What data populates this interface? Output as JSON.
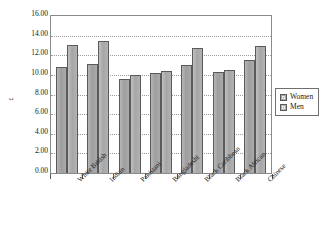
{
  "chart_data": {
    "type": "bar",
    "title": "",
    "xlabel": "",
    "ylabel": "£",
    "ylim": [
      0,
      16
    ],
    "ytick_step": 2,
    "ytick_labels": [
      "16.00",
      "14.00",
      "12.00",
      "10.00",
      "8.00",
      "6.00",
      "4.00",
      "2.00",
      "0.00"
    ],
    "grid": true,
    "legend_position": "right",
    "categories": [
      "White British",
      "Indian",
      "Pakistani",
      "Bangladeshi",
      "Black Caribbean",
      "Black African",
      "Chinese"
    ],
    "series": [
      {
        "name": "Women",
        "color": "#a8a8a8",
        "values": [
          10.8,
          11.1,
          9.6,
          10.2,
          11.0,
          10.3,
          11.5
        ]
      },
      {
        "name": "Men",
        "color": "#b4b4b4",
        "values": [
          13.0,
          13.5,
          10.0,
          10.4,
          12.7,
          10.5,
          12.9
        ]
      }
    ]
  },
  "legend": {
    "items": [
      {
        "label": "Women",
        "swatch": "legend-swatch-women"
      },
      {
        "label": "Men",
        "swatch": "legend-swatch-men"
      }
    ]
  }
}
